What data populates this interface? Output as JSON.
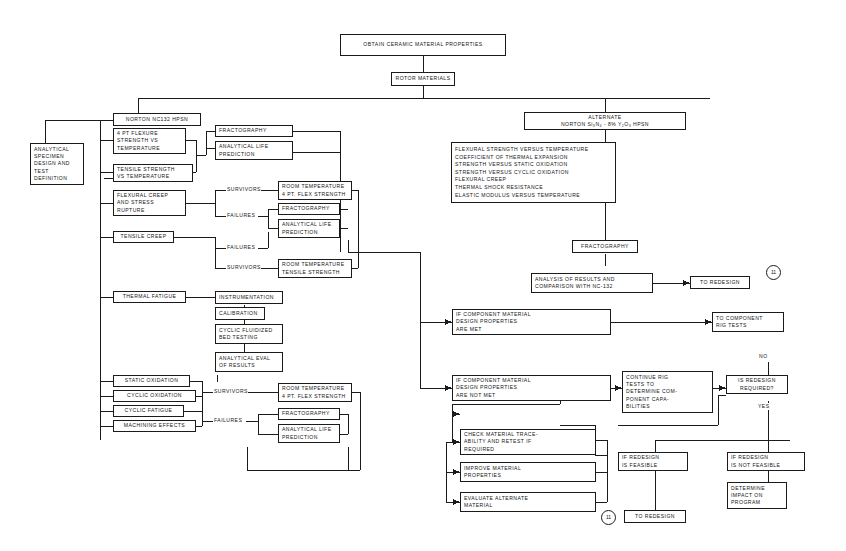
{
  "diagram": {
    "title_box": "OBTAIN CERAMIC MATERIAL PROPERTIES",
    "rotor_box": "ROTOR MATERIALS",
    "left_branch_header": "NORTON NC132 HPSN",
    "right_branch_header": "ALTERNATE\nNORTON Si₃N₄ - 8% Y₂O₃ HPSN",
    "analytical_specimen": "ANALYTICAL\nSPECIMEN\nDESIGN AND\nTEST\nDEFINITION",
    "tests": {
      "flexure_temp": "4 PT FLEXURE\nSTRENGTH VS\nTEMPERATURE",
      "tensile_temp": "TENSILE STRENGTH\nVS TEMPERATURE",
      "flexural_creep": "FLEXURAL CREEP\nAND STRESS\nRUPTURE",
      "tensile_creep": "TENSILE CREEP",
      "thermal_fatigue": "THERMAL FATIGUE",
      "static_oxidation": "STATIC OXIDATION",
      "cyclic_oxidation": "CYCLIC OXIDATION",
      "cyclic_fatigue": "CYCLIC FATIGUE",
      "machining_effects": "MACHINING EFFECTS"
    },
    "fractography_1": "FRACTOGRAPHY",
    "analytical_life_1": "ANALYTICAL LIFE\nPREDICTION",
    "survivors_1": "SURVIVORS",
    "failures_1": "FAILURES",
    "failures_2": "FAILURES",
    "survivors_2": "SURVIVORS",
    "rt_flex_1": "ROOM TEMPERATURE\n4 PT. FLEX STRENGTH",
    "fractography_2": "FRACTOGRAPHY",
    "analytical_life_2": "ANALYTICAL LIFE\nPREDICTION",
    "rt_tensile": "ROOM TEMPERATURE\nTENSILE STRENGTH",
    "thermal_chain": {
      "instrumentation": "INSTRUMENTATION",
      "calibration": "CALIBRATION",
      "cyclic_fluidized": "CYCLIC FLUIDIZED\nBED TESTING",
      "analytical_eval": "ANALYTICAL EVAL\nOF RESULTS"
    },
    "survivors_3": "SURVIVORS",
    "failures_3": "FAILURES",
    "rt_flex_2": "ROOM TEMPERATURE\n4 PT. FLEX STRENGTH",
    "fractography_3": "FRACTOGRAPHY",
    "analytical_life_3": "ANALYTICAL LIFE\nPREDICTION",
    "alternate_properties": "FLEXURAL STRENGTH VERSUS TEMPERATURE\nCOEFFICIENT OF THERMAL EXPANSION\nSTRENGTH VERSUS STATIC OXIDATION\nSTRENGTH VERSUS CYCLIC OXIDATION\nFLEXURAL CREEP\nTHERMAL SHOCK RESISTANCE\nELASTIC MODULUS VERSUS TEMPERATURE",
    "fractography_4": "FRACTOGRAPHY",
    "analysis_results": "ANALYSIS OF RESULTS AND\nCOMPARISON WITH NC-132",
    "to_redesign_1": "TO REDESIGN",
    "ref_marker_1": "11",
    "props_met": "IF COMPONENT MATERIAL\nDESIGN PROPERTIES\nARE MET",
    "to_component_rig": "TO COMPONENT\nRIG TESTS",
    "props_not_met": "IF COMPONENT MATERIAL\nDESIGN PROPERTIES\nARE NOT MET",
    "check_material": "CHECK MATERIAL TRACE-\nABILITY AND RETEST IF\nREQUIRED",
    "improve_material": "IMPROVE MATERIAL\nPROPERTIES",
    "evaluate_alternate": "EVALUATE ALTERNATE\nMATERIAL",
    "continue_rig": "CONTINUE RIG\nTESTS TO\nDETERMINE COM-\nPONENT CAPA-\nBILITIES",
    "is_redesign_required": "IS REDESIGN\nREQUIRED?",
    "no_label": "NO",
    "yes_label": "YES",
    "redesign_feasible": "IF REDESIGN\nIS FEASIBLE",
    "redesign_not_feasible": "IF REDESIGN\nIS NOT FEASIBLE",
    "determine_impact": "DETERMINE\nIMPACT ON\nPROGRAM",
    "to_redesign_2": "TO REDESIGN",
    "ref_marker_2": "11"
  }
}
